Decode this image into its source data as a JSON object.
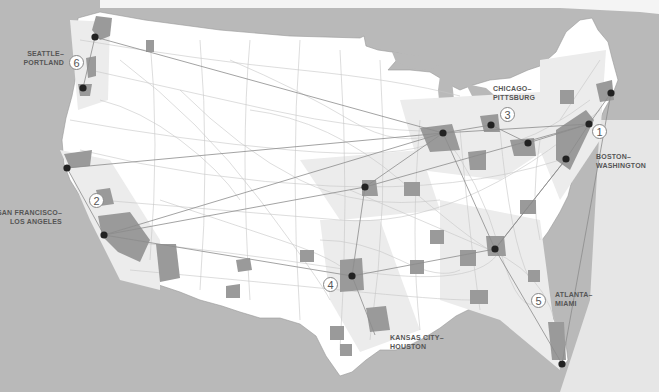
{
  "map": {
    "subject": "United States megaregions and high-speed rail corridors",
    "colors": {
      "water": "#b9b9b9",
      "land": "#ffffff",
      "megaregion_shading": "#ebebeb",
      "urban_areas": "#9a9a9a",
      "roads": "#c4c4c4",
      "rail_corridors": "#8c8c8c",
      "city_dot": "#222222"
    },
    "corridors": [
      {
        "number": "1",
        "name_line1": "BOSTON–",
        "name_line2": "WASHINGTON"
      },
      {
        "number": "2",
        "name_line1": "SAN FRANCISCO–",
        "name_line2": "LOS ANGELES"
      },
      {
        "number": "3",
        "name_line1": "CHICAGO–",
        "name_line2": "PITTSBURG"
      },
      {
        "number": "4",
        "name_line1": "KANSAS CITY–",
        "name_line2": "HOUSTON"
      },
      {
        "number": "5",
        "name_line1": "ATLANTA–",
        "name_line2": "MIAMI"
      },
      {
        "number": "6",
        "name_line1": "SEATTLE–",
        "name_line2": "PORTLAND"
      }
    ]
  }
}
